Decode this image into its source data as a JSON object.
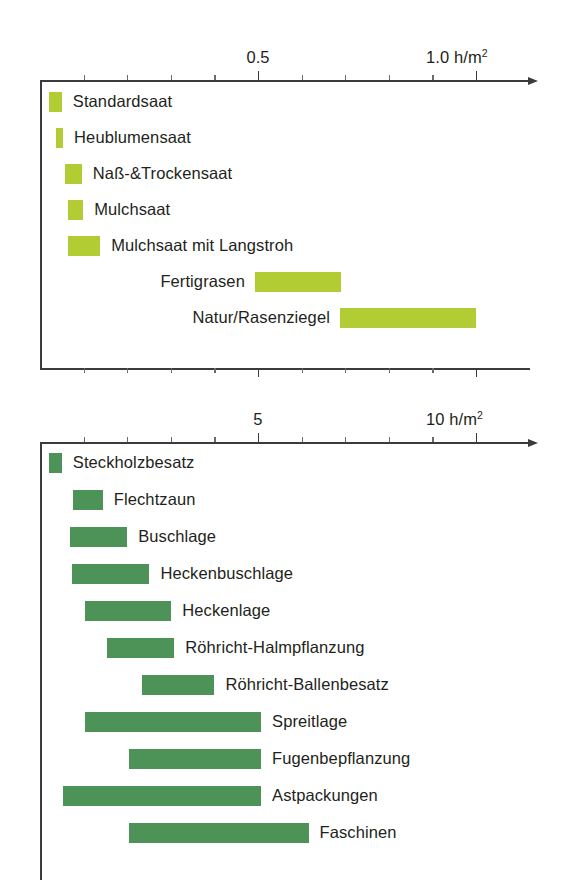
{
  "chart_data": [
    {
      "type": "bar",
      "orientation": "horizontal",
      "style": "range-bar",
      "title": "",
      "xlabel": "h/m²",
      "ylabel": "",
      "xlim": [
        0,
        1.0
      ],
      "grid": false,
      "legend": "none",
      "bar_color": "#b2cc33",
      "axis_label_right": "1.0 h/m²",
      "tick_labels": [
        {
          "value": 0.5,
          "text": "0.5"
        },
        {
          "value": 1.0,
          "text": "1.0 h/m²"
        }
      ],
      "minor_ticks": [
        0.1,
        0.2,
        0.3,
        0.4,
        0.5,
        0.6,
        0.7,
        0.8,
        0.9,
        1.0
      ],
      "categories": [
        "Standardsaat",
        "Heublumensaat",
        "Naß-&Trockensaat",
        "Mulchsaat",
        "Mulchsaat mit Langstroh",
        "Fertigrasen",
        "Natur/Rasenziegel"
      ],
      "ranges": [
        {
          "label": "Standardsaat",
          "start": 0.02,
          "end": 0.05,
          "label_side": "right"
        },
        {
          "label": "Heublumensaat",
          "start": 0.037,
          "end": 0.053,
          "label_side": "right"
        },
        {
          "label": "Naß-&Trockensaat",
          "start": 0.057,
          "end": 0.096,
          "label_side": "right"
        },
        {
          "label": "Mulchsaat",
          "start": 0.064,
          "end": 0.099,
          "label_side": "right"
        },
        {
          "label": "Mulchsaat mit Langstroh",
          "start": 0.064,
          "end": 0.138,
          "label_side": "right"
        },
        {
          "label": "Fertigrasen",
          "start": 0.493,
          "end": 0.69,
          "label_side": "left"
        },
        {
          "label": "Natur/Rasenziegel",
          "start": 0.688,
          "end": 1.0,
          "label_side": "left"
        }
      ]
    },
    {
      "type": "bar",
      "orientation": "horizontal",
      "style": "range-bar",
      "title": "",
      "xlabel": "h/m²",
      "ylabel": "",
      "xlim": [
        0,
        10
      ],
      "grid": false,
      "legend": "none",
      "bar_color": "#4d9257",
      "axis_label_right": "10 h/m²",
      "tick_labels": [
        {
          "value": 5,
          "text": "5"
        },
        {
          "value": 10,
          "text": "10 h/m²"
        }
      ],
      "minor_ticks": [
        1,
        2,
        3,
        4,
        5,
        6,
        7,
        8,
        9,
        10
      ],
      "categories": [
        "Steckholzbesatz",
        "Flechtzaun",
        "Buschlage",
        "Heckenbuschlage",
        "Heckenlage",
        "Röhricht-Halmpflanzung",
        "Röhricht-Ballenbesatz",
        "Spreitlage",
        "Fugenbepflanzung",
        "Astpackungen",
        "Faschinen"
      ],
      "ranges": [
        {
          "label": "Steckholzbesatz",
          "start": 0.2,
          "end": 0.5,
          "label_side": "right"
        },
        {
          "label": "Flechtzaun",
          "start": 0.75,
          "end": 1.44,
          "label_side": "right"
        },
        {
          "label": "Buschlage",
          "start": 0.68,
          "end": 2.0,
          "label_side": "right"
        },
        {
          "label": "Heckenbuschlage",
          "start": 0.73,
          "end": 2.51,
          "label_side": "right"
        },
        {
          "label": "Heckenlage",
          "start": 1.03,
          "end": 3.01,
          "label_side": "right"
        },
        {
          "label": "Röhricht-Halmpflanzung",
          "start": 1.53,
          "end": 3.08,
          "label_side": "right"
        },
        {
          "label": "Röhricht-Ballenbesatz",
          "start": 2.35,
          "end": 4.0,
          "label_side": "right"
        },
        {
          "label": "Spreitlage",
          "start": 1.03,
          "end": 5.07,
          "label_side": "right"
        },
        {
          "label": "Fugenbepflanzung",
          "start": 2.05,
          "end": 5.07,
          "label_side": "right"
        },
        {
          "label": "Astpackungen",
          "start": 0.53,
          "end": 5.07,
          "label_side": "right"
        },
        {
          "label": "Faschinen",
          "start": 2.05,
          "end": 6.16,
          "label_side": "right"
        }
      ]
    }
  ]
}
